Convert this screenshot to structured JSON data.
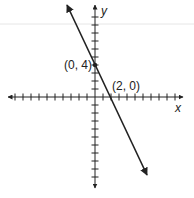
{
  "chart_data": {
    "type": "line",
    "title": "",
    "xlabel": "x",
    "ylabel": "y",
    "xlim": [
      -11,
      11
    ],
    "ylim": [
      -11,
      11
    ],
    "grid": false,
    "equation": "y = -2x + 4",
    "series": [
      {
        "name": "line",
        "x": [
          -3.5,
          6.5
        ],
        "y": [
          11,
          -10
        ]
      }
    ],
    "points": [
      {
        "label": "(0, 4)",
        "x": 0,
        "y": 4,
        "marked": true
      },
      {
        "label": "(2, 0)",
        "x": 2,
        "y": 0,
        "marked": false
      }
    ]
  },
  "labels": {
    "x_axis": "x",
    "y_axis": "y",
    "point_y_intercept": "(0, 4)",
    "point_x_intercept": "(2, 0)"
  },
  "colors": {
    "ink": "#222222",
    "artifact_line": "#e6e6e6"
  }
}
